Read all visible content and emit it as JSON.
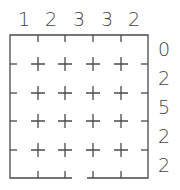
{
  "puzzle": {
    "columns": 5,
    "rows": 5,
    "column_clues": [
      "1",
      "2",
      "3",
      "3",
      "2"
    ],
    "row_clues": [
      "0",
      "2",
      "5",
      "2",
      "2"
    ],
    "line_color": "#4a4a4a",
    "exit_gap": {
      "edge": "bottom",
      "between_columns": [
        2,
        3
      ]
    }
  }
}
